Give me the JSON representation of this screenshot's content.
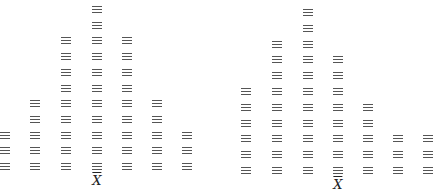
{
  "symbol": "triple-bar (≡)",
  "panels": [
    {
      "name": "symmetric-distribution",
      "mean_label": "X",
      "columns_x": [
        5,
        35,
        66,
        97,
        127,
        157,
        187
      ],
      "counts": [
        3,
        5,
        9,
        11,
        9,
        5,
        3
      ],
      "bottom_y": 166,
      "row_spacing": 15.7,
      "label_x": 97,
      "label_y": 174
    },
    {
      "name": "skewed-distribution",
      "mean_label": "X",
      "columns_x": [
        246,
        277,
        308,
        338,
        368,
        398,
        428
      ],
      "counts": [
        6,
        9,
        11,
        8,
        5,
        3,
        3
      ],
      "bottom_y": 170,
      "row_spacing": 15.8,
      "label_x": 338,
      "label_y": 178
    }
  ]
}
